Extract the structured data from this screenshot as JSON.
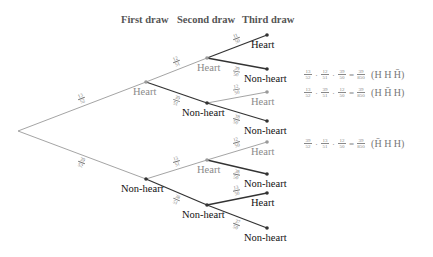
{
  "headers": {
    "first": "First draw",
    "second": "Second draw",
    "third": "Third draw"
  },
  "nodes": {
    "root": {
      "x": 18,
      "y": 131
    },
    "first": [
      {
        "label": "Heart",
        "x": 146,
        "y": 82,
        "style": "gray"
      },
      {
        "label": "Non-heart",
        "x": 146,
        "y": 179,
        "style": "dark"
      }
    ],
    "second": [
      {
        "label": "Heart",
        "x": 207,
        "y": 58,
        "style": "gray"
      },
      {
        "label": "Non-heart",
        "x": 207,
        "y": 103,
        "style": "dark"
      },
      {
        "label": "Heart",
        "x": 207,
        "y": 160,
        "style": "gray"
      },
      {
        "label": "Non-heart",
        "x": 207,
        "y": 205,
        "style": "dark"
      }
    ],
    "third": [
      {
        "label": "Heart",
        "x": 267,
        "y": 35,
        "style": "dark"
      },
      {
        "label": "Non-heart",
        "x": 267,
        "y": 69,
        "style": "dark"
      },
      {
        "label": "Heart",
        "x": 267,
        "y": 92,
        "style": "gray"
      },
      {
        "label": "Non-heart",
        "x": 267,
        "y": 121,
        "style": "dark"
      },
      {
        "label": "Heart",
        "x": 267,
        "y": 142,
        "style": "gray"
      },
      {
        "label": "Non-heart",
        "x": 267,
        "y": 174,
        "style": "dark"
      },
      {
        "label": "Heart",
        "x": 267,
        "y": 193,
        "style": "dark"
      },
      {
        "label": "Non-heart",
        "x": 267,
        "y": 228,
        "style": "dark"
      }
    ]
  },
  "branch_probs": {
    "first": [
      {
        "num": "13",
        "den": "52"
      },
      {
        "num": "39",
        "den": "52"
      }
    ],
    "second": [
      {
        "num": "12",
        "den": "51"
      },
      {
        "num": "39",
        "den": "51"
      },
      {
        "num": "13",
        "den": "51"
      },
      {
        "num": "38",
        "den": "51"
      }
    ],
    "third": [
      {
        "num": "11",
        "den": "50"
      },
      {
        "num": "39",
        "den": "50"
      },
      {
        "num": "12",
        "den": "50"
      },
      {
        "num": "38",
        "den": "50"
      },
      {
        "num": "12",
        "den": "50"
      },
      {
        "num": "38",
        "den": "50"
      },
      {
        "num": "13",
        "den": "50"
      },
      {
        "num": "37",
        "den": "50"
      }
    ]
  },
  "formulas": [
    {
      "factors": [
        {
          "num": "13",
          "den": "52"
        },
        {
          "num": "12",
          "den": "51"
        },
        {
          "num": "39",
          "den": "50"
        }
      ],
      "result": {
        "num": "39",
        "den": "850"
      },
      "seq": [
        "H",
        "H",
        "H̄"
      ],
      "y": 75
    },
    {
      "factors": [
        {
          "num": "13",
          "den": "52"
        },
        {
          "num": "39",
          "den": "51"
        },
        {
          "num": "12",
          "den": "50"
        }
      ],
      "result": {
        "num": "39",
        "den": "850"
      },
      "seq": [
        "H",
        "H̄",
        "H"
      ],
      "y": 93
    },
    {
      "factors": [
        {
          "num": "39",
          "den": "52"
        },
        {
          "num": "13",
          "den": "51"
        },
        {
          "num": "12",
          "den": "50"
        }
      ],
      "result": {
        "num": "39",
        "den": "850"
      },
      "seq": [
        "H̄",
        "H",
        "H"
      ],
      "y": 144
    }
  ],
  "symbols": {
    "dot": "·",
    "eq": "="
  },
  "colors": {
    "line_gray": "#9a9a9a",
    "line_dark": "#333333",
    "text_gray": "#8a8a8a",
    "text_dark": "#111111"
  }
}
